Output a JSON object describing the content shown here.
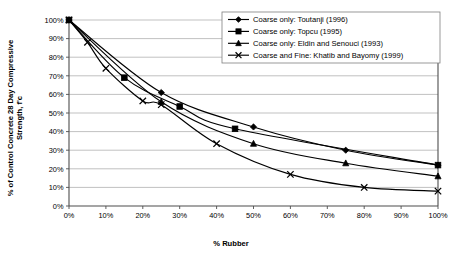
{
  "chart_data": {
    "type": "line",
    "title": "",
    "xlabel": "% Rubber",
    "ylabel": "% of Control Concrete 28 Day Compressive Strength, f'c",
    "xlim": [
      0,
      100
    ],
    "ylim": [
      0,
      100
    ],
    "grid": true,
    "legend_position": "top-right",
    "x_ticks": [
      "0%",
      "10%",
      "20%",
      "30%",
      "40%",
      "50%",
      "60%",
      "70%",
      "80%",
      "90%",
      "100%"
    ],
    "y_ticks": [
      "0%",
      "10%",
      "20%",
      "30%",
      "40%",
      "50%",
      "60%",
      "70%",
      "80%",
      "90%",
      "100%"
    ],
    "series": [
      {
        "name": "Coarse only: Toutanji (1996)",
        "marker": "diamond",
        "points": [
          {
            "x": 0,
            "y": 100
          },
          {
            "x": 25,
            "y": 61
          },
          {
            "x": 50,
            "y": 42.5
          },
          {
            "x": 75,
            "y": 30
          },
          {
            "x": 100,
            "y": 22
          }
        ]
      },
      {
        "name": "Coarse only: Topcu (1995)",
        "marker": "square",
        "points": [
          {
            "x": 0,
            "y": 100
          },
          {
            "x": 15,
            "y": 69
          },
          {
            "x": 30,
            "y": 53.5
          },
          {
            "x": 45,
            "y": 41.5
          },
          {
            "x": 100,
            "y": 22
          }
        ]
      },
      {
        "name": "Coarse only: Eldin and Senouci (1993)",
        "marker": "triangle",
        "points": [
          {
            "x": 0,
            "y": 100
          },
          {
            "x": 25,
            "y": 56
          },
          {
            "x": 50,
            "y": 33.5
          },
          {
            "x": 75,
            "y": 23
          },
          {
            "x": 100,
            "y": 16
          }
        ]
      },
      {
        "name": "Coarse and Fine: Khatib and Bayomy (1999)",
        "marker": "x",
        "points": [
          {
            "x": 0,
            "y": 100
          },
          {
            "x": 5,
            "y": 88
          },
          {
            "x": 10,
            "y": 74
          },
          {
            "x": 20,
            "y": 56.5
          },
          {
            "x": 25,
            "y": 54.5
          },
          {
            "x": 40,
            "y": 33.5
          },
          {
            "x": 60,
            "y": 17
          },
          {
            "x": 80,
            "y": 10
          },
          {
            "x": 100,
            "y": 8
          }
        ]
      }
    ]
  },
  "legend": {
    "entries": [
      {
        "label": "Coarse only: Toutanji (1996)",
        "marker": "diamond"
      },
      {
        "label": "Coarse only: Topcu (1995)",
        "marker": "square"
      },
      {
        "label": "Coarse only: Eldin and Senouci (1993)",
        "marker": "triangle"
      },
      {
        "label": "Coarse and Fine: Khatib and Bayomy (1999)",
        "marker": "x"
      }
    ]
  },
  "colors": {
    "series": "#000000",
    "grid": "#a6a6a6",
    "axis": "#4d4d4d",
    "background": "#ffffff"
  }
}
